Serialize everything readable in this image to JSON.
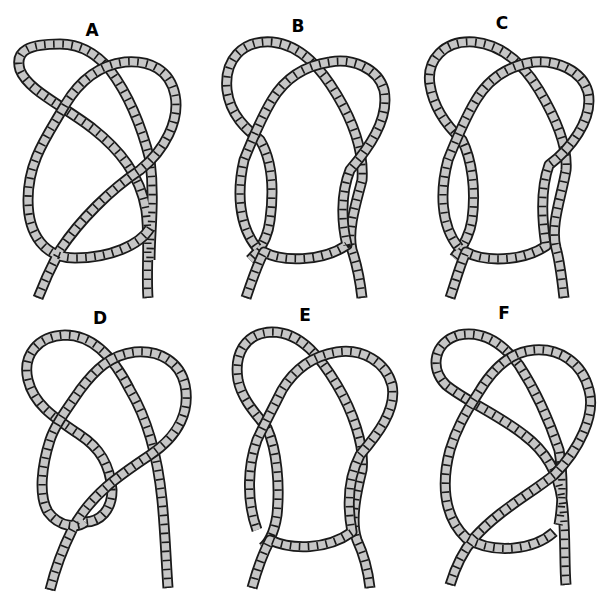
{
  "figure": {
    "colors": {
      "background": "#ffffff",
      "rope_fill": "#c6c6c6",
      "rope_outline": "#1a1a1a",
      "label": "#000000"
    },
    "panels": [
      {
        "id": "A",
        "label": "A"
      },
      {
        "id": "B",
        "label": "B"
      },
      {
        "id": "C",
        "label": "C"
      },
      {
        "id": "D",
        "label": "D"
      },
      {
        "id": "E",
        "label": "E"
      },
      {
        "id": "F",
        "label": "F"
      }
    ]
  }
}
